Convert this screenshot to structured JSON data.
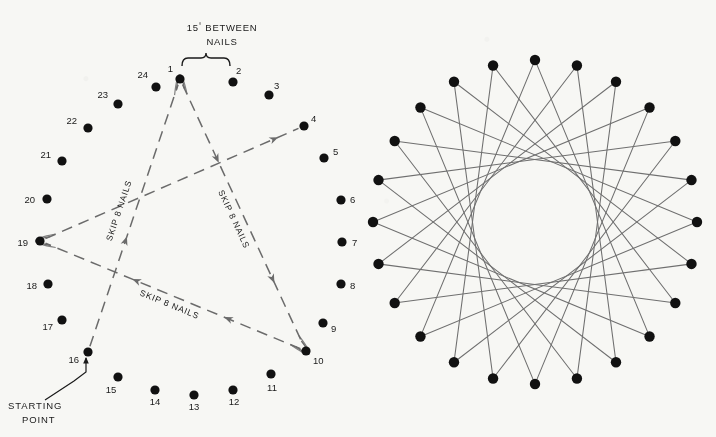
{
  "figure": {
    "background_color": "#f7f7f4",
    "nail_color": "#111111",
    "thread_color_dashed": "#6b6b6b",
    "thread_color_light": "#6f6f6f",
    "thread_color_dark": "#141414",
    "text_color": "#1a1a1a"
  },
  "left_panel": {
    "name": "nail-layout-and-threading-diagram",
    "center": {
      "x": 172,
      "y": 238
    },
    "radius": 152,
    "nail_count": 24,
    "angle_between_nails": 15,
    "angle_label": {
      "line1": "15° BETWEEN",
      "line2": "NAILS"
    },
    "starting_point_label": {
      "line1": "STARTING",
      "line2": "POINT",
      "points_to_nail": 16
    },
    "skip_label": "SKIP 8 NAILS",
    "skip_count": 8,
    "nails": [
      {
        "number": 1,
        "x": 180,
        "y": 79,
        "label_x": 173,
        "label_y": 72,
        "label_anchor": "end"
      },
      {
        "number": 2,
        "x": 233,
        "y": 82,
        "label_x": 236,
        "label_y": 74,
        "label_anchor": "start"
      },
      {
        "number": 3,
        "x": 269,
        "y": 95,
        "label_x": 274,
        "label_y": 89,
        "label_anchor": "start"
      },
      {
        "number": 4,
        "x": 304,
        "y": 126,
        "label_x": 311,
        "label_y": 122,
        "label_anchor": "start"
      },
      {
        "number": 5,
        "x": 324,
        "y": 158,
        "label_x": 333,
        "label_y": 155,
        "label_anchor": "start"
      },
      {
        "number": 6,
        "x": 341,
        "y": 200,
        "label_x": 350,
        "label_y": 203,
        "label_anchor": "start"
      },
      {
        "number": 7,
        "x": 342,
        "y": 242,
        "label_x": 352,
        "label_y": 246,
        "label_anchor": "start"
      },
      {
        "number": 8,
        "x": 341,
        "y": 284,
        "label_x": 350,
        "label_y": 289,
        "label_anchor": "start"
      },
      {
        "number": 9,
        "x": 323,
        "y": 323,
        "label_x": 331,
        "label_y": 332,
        "label_anchor": "start"
      },
      {
        "number": 10,
        "x": 306,
        "y": 351,
        "label_x": 313,
        "label_y": 364,
        "label_anchor": "start"
      },
      {
        "number": 11,
        "x": 271,
        "y": 374,
        "label_x": 272,
        "label_y": 391,
        "label_anchor": "middle"
      },
      {
        "number": 12,
        "x": 233,
        "y": 390,
        "label_x": 234,
        "label_y": 405,
        "label_anchor": "middle"
      },
      {
        "number": 13,
        "x": 194,
        "y": 395,
        "label_x": 194,
        "label_y": 410,
        "label_anchor": "middle"
      },
      {
        "number": 14,
        "x": 155,
        "y": 390,
        "label_x": 155,
        "label_y": 405,
        "label_anchor": "middle"
      },
      {
        "number": 15,
        "x": 118,
        "y": 377,
        "label_x": 111,
        "label_y": 393,
        "label_anchor": "middle"
      },
      {
        "number": 16,
        "x": 88,
        "y": 352,
        "label_x": 79,
        "label_y": 363,
        "label_anchor": "end"
      },
      {
        "number": 17,
        "x": 62,
        "y": 320,
        "label_x": 53,
        "label_y": 330,
        "label_anchor": "end"
      },
      {
        "number": 18,
        "x": 48,
        "y": 284,
        "label_x": 37,
        "label_y": 289,
        "label_anchor": "end"
      },
      {
        "number": 19,
        "x": 40,
        "y": 241,
        "label_x": 28,
        "label_y": 246,
        "label_anchor": "end"
      },
      {
        "number": 20,
        "x": 47,
        "y": 199,
        "label_x": 35,
        "label_y": 203,
        "label_anchor": "end"
      },
      {
        "number": 21,
        "x": 62,
        "y": 161,
        "label_x": 51,
        "label_y": 158,
        "label_anchor": "end"
      },
      {
        "number": 22,
        "x": 88,
        "y": 128,
        "label_x": 77,
        "label_y": 124,
        "label_anchor": "end"
      },
      {
        "number": 23,
        "x": 118,
        "y": 104,
        "label_x": 108,
        "label_y": 98,
        "label_anchor": "end"
      },
      {
        "number": 24,
        "x": 156,
        "y": 87,
        "label_x": 148,
        "label_y": 78,
        "label_anchor": "end"
      }
    ],
    "thread_path": [
      {
        "from": 16,
        "to": 1,
        "label": "SKIP 8 NAILS"
      },
      {
        "from": 1,
        "to": 10,
        "label": "SKIP 8 NAILS"
      },
      {
        "from": 10,
        "to": 19,
        "label": "SKIP 8 NAILS"
      },
      {
        "from": 19,
        "to": 4,
        "label": ""
      }
    ]
  },
  "right_panel": {
    "name": "completed-string-art-pattern",
    "center": {
      "x": 535,
      "y": 222
    },
    "radius": 162,
    "nail_count": 24,
    "skip_count": 8,
    "envelope_radius": 56,
    "highlighted_triangle_nails": [
      1,
      9,
      17
    ]
  }
}
